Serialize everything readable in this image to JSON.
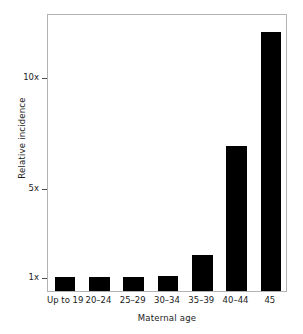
{
  "chart_data": {
    "type": "bar",
    "title": "",
    "xlabel": "Maternal age",
    "ylabel": "Relative incidence",
    "categories": [
      "Up to 19",
      "20–24",
      "25–29",
      "30–34",
      "35–39",
      "40–44",
      "45"
    ],
    "values": [
      1.0,
      1.0,
      1.0,
      1.05,
      2.0,
      6.9,
      12.0
    ],
    "ytick_values": [
      1,
      5,
      10
    ],
    "ytick_labels": [
      "1x",
      "5x",
      "10x"
    ],
    "ylim": [
      0.38,
      12.85
    ],
    "grid": false,
    "legend": false,
    "bar_color": "#000000",
    "frame_color": "#b3b3b3",
    "text_color": "#1a1a1a"
  }
}
